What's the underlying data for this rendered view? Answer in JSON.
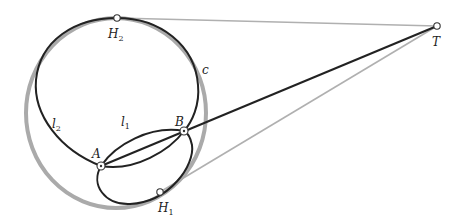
{
  "diagram": {
    "colors": {
      "dark": "#222222",
      "gray": "#aaaaaa",
      "light_gray": "#b8b8b8"
    },
    "points": {
      "H2": {
        "label": "H",
        "sub": "2",
        "x": 117,
        "y": 18
      },
      "T": {
        "label": "T",
        "sub": "",
        "x": 437,
        "y": 26
      },
      "A": {
        "label": "A",
        "sub": "",
        "x": 101,
        "y": 166
      },
      "B": {
        "label": "B",
        "sub": "",
        "x": 184,
        "y": 131
      },
      "H1": {
        "label": "H",
        "sub": "1",
        "x": 160,
        "y": 192
      }
    },
    "curves": {
      "c": {
        "label": "c"
      },
      "l1": {
        "label": "l",
        "sub": "1"
      },
      "l2": {
        "label": "l",
        "sub": "2"
      }
    },
    "segments": [
      {
        "from": "H2",
        "to": "T",
        "color": "gray"
      },
      {
        "from": "A",
        "to": "T",
        "color": "dark"
      },
      {
        "from": "H1",
        "to": "T",
        "color": "gray"
      }
    ]
  }
}
